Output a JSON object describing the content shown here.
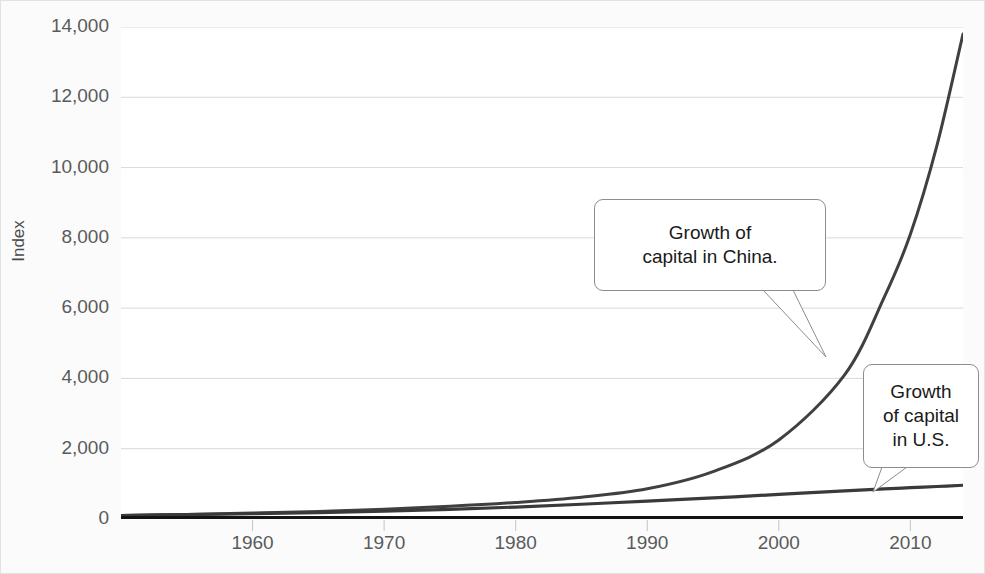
{
  "chart_data": {
    "type": "line",
    "title": "Capital (Wealth) Growth\nU.S. vs. China",
    "title_line1": "Capital (Wealth) Growth",
    "title_line2": "U.S. vs. China",
    "xlabel": "",
    "ylabel": "Index",
    "ylim": [
      0,
      14000
    ],
    "xlim": [
      1950,
      2014
    ],
    "grid": true,
    "legend": "none",
    "y_ticks": [
      "0",
      "2,000",
      "4,000",
      "6,000",
      "8,000",
      "10,000",
      "12,000",
      "14,000"
    ],
    "y_tick_values": [
      0,
      2000,
      4000,
      6000,
      8000,
      10000,
      12000,
      14000
    ],
    "x_ticks": [
      "1960",
      "1970",
      "1980",
      "1990",
      "2000",
      "2010"
    ],
    "x_tick_values": [
      1960,
      1970,
      1980,
      1990,
      2000,
      2010
    ],
    "series": [
      {
        "name": "Growth of capital in China",
        "color": "#404040",
        "x": [
          1950,
          1955,
          1960,
          1965,
          1970,
          1975,
          1980,
          1985,
          1990,
          1995,
          2000,
          2005,
          2008,
          2010,
          2012,
          2014
        ],
        "values": [
          100,
          130,
          170,
          215,
          280,
          360,
          470,
          620,
          860,
          1350,
          2250,
          4100,
          6300,
          8100,
          10600,
          13800
        ]
      },
      {
        "name": "Growth of capital in U.S.",
        "color": "#3a3a3a",
        "x": [
          1950,
          1955,
          1960,
          1965,
          1970,
          1975,
          1980,
          1985,
          1990,
          1995,
          2000,
          2005,
          2008,
          2010,
          2012,
          2014
        ],
        "values": [
          100,
          125,
          150,
          180,
          220,
          275,
          340,
          420,
          510,
          600,
          700,
          800,
          855,
          890,
          925,
          960
        ]
      }
    ],
    "annotations": [
      {
        "id": "china",
        "text": "Growth of\ncapital in China.",
        "points_to_series": "Growth of capital in China",
        "point_x": 2005,
        "point_y": 4300
      },
      {
        "id": "us",
        "text": "Growth\nof capital\nin U.S.",
        "points_to_series": "Growth of capital in U.S.",
        "point_x": 2008,
        "point_y": 855
      }
    ]
  }
}
